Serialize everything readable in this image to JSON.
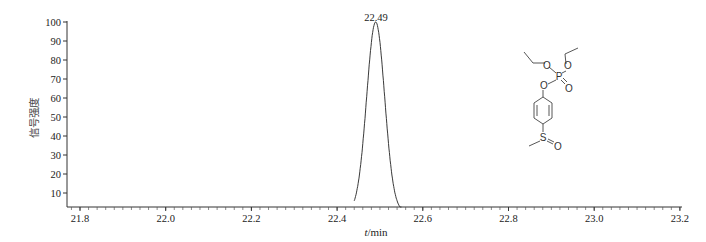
{
  "chart_data": {
    "type": "line",
    "title": "",
    "xlabel_italic": "t",
    "xlabel_unit": "/min",
    "xlabel": "t/min",
    "ylabel": "信号强度",
    "xlim": [
      21.77,
      23.2
    ],
    "ylim": [
      2.5,
      100
    ],
    "x_ticks": [
      21.8,
      22.0,
      22.2,
      22.4,
      22.6,
      22.8,
      23.0,
      23.2
    ],
    "x_tick_labels": [
      "21.8",
      "22.0",
      "22.2",
      "22.4",
      "22.6",
      "22.8",
      "23.0",
      "23.2"
    ],
    "y_ticks": [
      10,
      20,
      30,
      40,
      50,
      60,
      70,
      80,
      90,
      100
    ],
    "y_tick_labels": [
      "10",
      "20",
      "30",
      "40",
      "50",
      "60",
      "70",
      "80",
      "90",
      "100"
    ],
    "grid": false,
    "legend": null,
    "series": [
      {
        "name": "chromatogram",
        "peak_center": 22.49,
        "peak_height": 100,
        "peak_start": 22.44,
        "peak_end": 22.55,
        "x": [
          22.44,
          22.45,
          22.46,
          22.47,
          22.48,
          22.49,
          22.5,
          22.51,
          22.52,
          22.53,
          22.54,
          22.55
        ],
        "values": [
          2.5,
          8,
          30,
          62,
          90,
          100,
          88,
          58,
          28,
          10,
          4,
          2.5
        ]
      }
    ],
    "annotations": [
      {
        "text": "22.49",
        "x": 22.49,
        "y": 100,
        "position": "above-peak"
      }
    ],
    "structure_inset": {
      "description": "diethyl 4-(methylsulfinyl)phenyl phosphate (fensulfothion oxon)",
      "atoms": [
        "O",
        "P",
        "O",
        "O",
        "O",
        "S",
        "O"
      ]
    }
  },
  "labels": {
    "peak_label": "22.49",
    "x_axis_italic": "t",
    "x_axis_unit": "/min",
    "y_axis": "信号强度"
  },
  "structure": {
    "atom_O1": "O",
    "atom_O2": "O",
    "atom_P": "P",
    "atom_O3": "O",
    "atom_O4": "O",
    "atom_S": "S",
    "atom_O5": "O"
  }
}
